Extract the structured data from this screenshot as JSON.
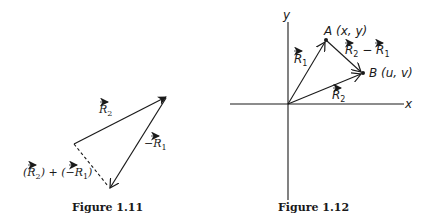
{
  "figures": [
    {
      "caption": "Figure 1.11",
      "labels": {
        "r2": "R",
        "r2_sub": "2",
        "neg_r1": "−R",
        "neg_r1_sub": "1",
        "sum": "(R",
        "sum_sub1": "2",
        "sum_mid": ") + (−R",
        "sum_sub2": "1",
        "sum_end": ")"
      }
    },
    {
      "caption": "Figure 1.12",
      "axes": {
        "x": "x",
        "y": "y"
      },
      "points": {
        "A": "A (x, y)",
        "B": "B (u, v)"
      },
      "labels": {
        "r1": "R",
        "r1_sub": "1",
        "r2": "R",
        "r2_sub": "2",
        "diff_a": "R",
        "diff_a_sub": "2",
        "diff_mid": " − R",
        "diff_b_sub": "1"
      }
    }
  ],
  "colors": {
    "ink": "#1a1a1a",
    "background": "#ffffff"
  }
}
